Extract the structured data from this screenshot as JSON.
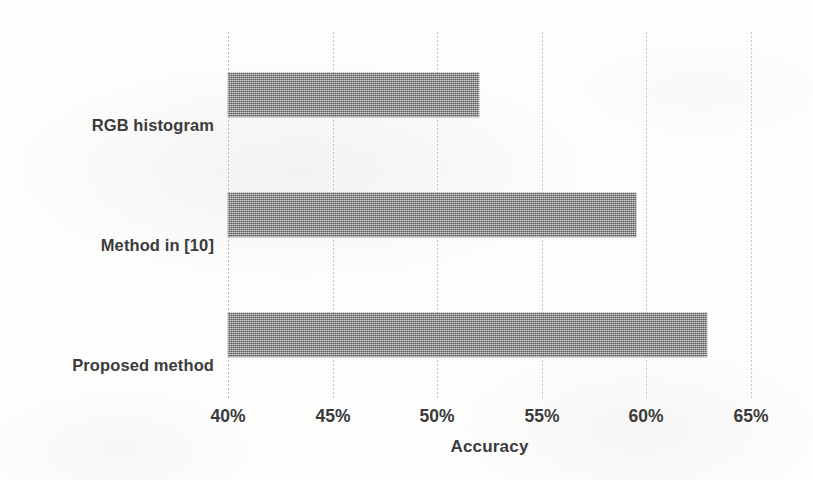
{
  "chart_data": {
    "type": "bar",
    "orientation": "horizontal",
    "title": "",
    "subtitle": "",
    "xlabel": "Accuracy",
    "ylabel": "",
    "categories": [
      "RGB histogram",
      "Method in [10]",
      "Proposed method"
    ],
    "values": [
      52.0,
      59.5,
      62.9
    ],
    "value_unit": "%",
    "xlim": [
      40,
      65
    ],
    "xticks": [
      40,
      45,
      50,
      55,
      60,
      65
    ],
    "xtick_labels": [
      "40%",
      "45%",
      "50%",
      "55%",
      "60%",
      "65%"
    ],
    "grid": "vertical-dotted",
    "legend": "none",
    "series": [
      {
        "name": "Accuracy",
        "values": [
          52.0,
          59.5,
          62.9
        ],
        "color": "#8d8d8d",
        "fill_pattern": "fine-checker-dither"
      }
    ],
    "bars": [
      {
        "category": "RGB histogram",
        "value": 52.0,
        "label": "52%"
      },
      {
        "category": "Method in [10]",
        "value": 59.5,
        "label": "59.5%"
      },
      {
        "category": "Proposed method",
        "value": 62.9,
        "label": "62.9%"
      }
    ]
  },
  "colors": {
    "background": "#fdfdfc",
    "bar_fill": "#8d8d8d",
    "gridline": "#c3c5c8",
    "axis_line": "#b6b8bc",
    "text": "#3b3b3d"
  }
}
